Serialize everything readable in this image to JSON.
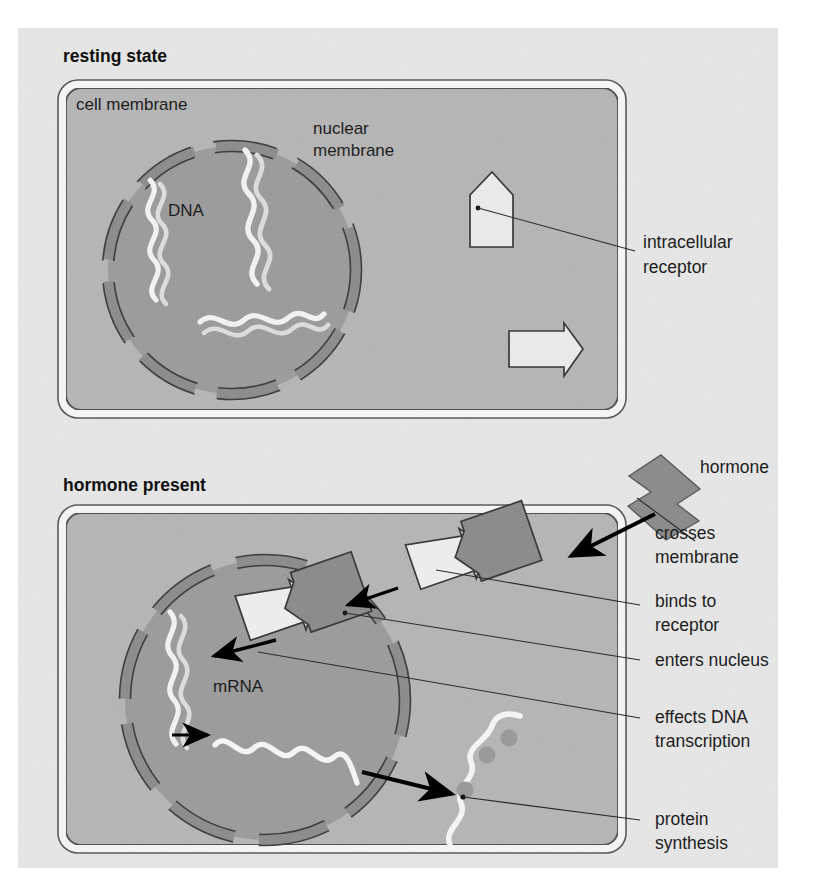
{
  "figure": {
    "title_visible": false,
    "topic": "intracellular (nuclear) hormone receptor signalling",
    "background_color": "#e9e9e9",
    "page_color": "#ffffff"
  },
  "colors": {
    "page": "#ffffff",
    "panel_background": "#e4e4e4",
    "cytoplasm": "#b4b4b4",
    "nucleoplasm": "#9b9b9b",
    "nuclear_membrane": "#8e8e8e",
    "membrane_band": "#f2f2f2",
    "outline": "#3a3a3a",
    "receptor_fill": "#e7e7e7",
    "hormone_fill": "#8c8c8c",
    "dna_light": "#f2f2f2",
    "mrna": "#f4f4f4",
    "ribosome": "#9a9a9a",
    "text": "#1d1d1d"
  },
  "panels": [
    {
      "id": "resting",
      "caption": "resting state",
      "labels_inside": [
        {
          "name": "cell membrane",
          "text": "cell membrane"
        },
        {
          "name": "nuclear membrane",
          "text": "nuclear\nmembrane",
          "lines": [
            "nuclear",
            "membrane"
          ]
        },
        {
          "name": "DNA",
          "text": "DNA"
        }
      ],
      "labels_outside": [
        {
          "name": "intracellular receptor",
          "lines": [
            "intracellular",
            "receptor"
          ]
        }
      ],
      "objects": [
        {
          "name": "nucleus",
          "description": "circle with dashed nuclear membrane containing DNA double helices"
        },
        {
          "name": "dna-strand",
          "count": 3
        },
        {
          "name": "intracellular-receptor",
          "count": 2,
          "state": "unbound",
          "fill": "#e7e7e7"
        }
      ]
    },
    {
      "id": "hormone-present",
      "caption": "hormone present",
      "labels_inside": [
        {
          "name": "mRNA",
          "text": "mRNA"
        }
      ],
      "labels_outside": [
        {
          "name": "hormone",
          "lines": [
            "hormone"
          ]
        },
        {
          "name": "crosses membrane",
          "lines": [
            "crosses",
            "membrane"
          ]
        },
        {
          "name": "binds to receptor",
          "lines": [
            "binds to",
            "receptor"
          ]
        },
        {
          "name": "enters nucleus",
          "lines": [
            "enters nucleus"
          ]
        },
        {
          "name": "effects DNA transcription",
          "lines": [
            "effects DNA",
            "transcription"
          ]
        },
        {
          "name": "protein synthesis",
          "lines": [
            "protein",
            "synthesis"
          ]
        }
      ],
      "objects": [
        {
          "name": "free-hormone",
          "count": 1,
          "fill": "#8c8c8c"
        },
        {
          "name": "hormone-receptor-complex",
          "count": 2,
          "fill_receptor": "#e7e7e7",
          "fill_hormone": "#8c8c8c"
        },
        {
          "name": "dna-strand",
          "count": 1
        },
        {
          "name": "mrna-strand-nucleus",
          "count": 1
        },
        {
          "name": "mrna-strand-cytoplasm",
          "count": 1
        },
        {
          "name": "ribosome",
          "count": 3,
          "fill": "#9a9a9a"
        }
      ]
    }
  ],
  "captions": {
    "resting": "resting state",
    "hormone_present": "hormone present"
  },
  "text": {
    "cell_membrane": "cell membrane",
    "nuclear_membrane_l1": "nuclear",
    "nuclear_membrane_l2": "membrane",
    "dna": "DNA",
    "intracellular_receptor_l1": "intracellular",
    "intracellular_receptor_l2": "receptor",
    "hormone": "hormone",
    "crosses_l1": "crosses",
    "crosses_l2": "membrane",
    "binds_l1": "binds to",
    "binds_l2": "receptor",
    "enters_nucleus": "enters nucleus",
    "effects_l1": "effects DNA",
    "effects_l2": "transcription",
    "protein_l1": "protein",
    "protein_l2": "synthesis",
    "mrna": "mRNA"
  }
}
